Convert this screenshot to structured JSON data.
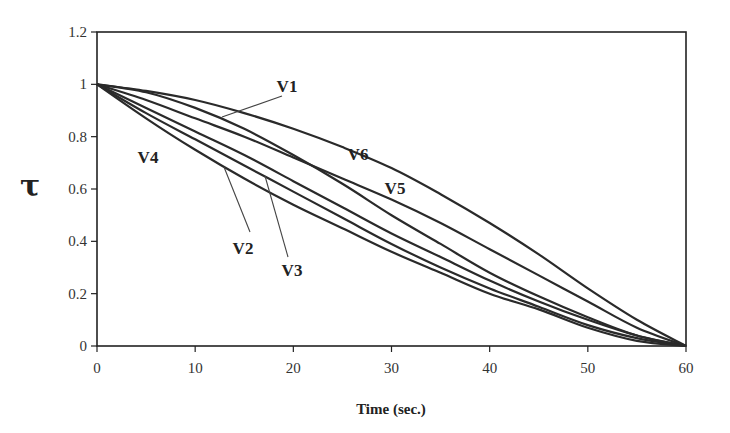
{
  "chart_data": {
    "type": "line",
    "title": "",
    "xlabel": "Time (sec.)",
    "ylabel": "τ",
    "xlim": [
      0,
      60
    ],
    "ylim": [
      0,
      1.2
    ],
    "x_ticks": [
      "0",
      "10",
      "20",
      "30",
      "40",
      "50",
      "60"
    ],
    "y_ticks": [
      "0",
      "0.2",
      "0.4",
      "0.6",
      "0.8",
      "1",
      "1.2"
    ],
    "grid": false,
    "legend": "inline labels",
    "x": [
      0,
      5,
      10,
      15,
      20,
      25,
      30,
      35,
      40,
      45,
      50,
      55,
      60
    ],
    "series": [
      {
        "name": "V6",
        "values": [
          1,
          0.975,
          0.94,
          0.89,
          0.83,
          0.76,
          0.68,
          0.58,
          0.47,
          0.35,
          0.22,
          0.1,
          0
        ]
      },
      {
        "name": "V1",
        "values": [
          1,
          0.97,
          0.91,
          0.83,
          0.73,
          0.62,
          0.5,
          0.39,
          0.28,
          0.19,
          0.11,
          0.04,
          0
        ]
      },
      {
        "name": "V5",
        "values": [
          1,
          0.94,
          0.87,
          0.8,
          0.72,
          0.64,
          0.56,
          0.47,
          0.37,
          0.27,
          0.17,
          0.07,
          0
        ]
      },
      {
        "name": "V3",
        "values": [
          1,
          0.91,
          0.82,
          0.73,
          0.63,
          0.53,
          0.43,
          0.34,
          0.25,
          0.17,
          0.1,
          0.04,
          0
        ]
      },
      {
        "name": "V2",
        "values": [
          1,
          0.89,
          0.79,
          0.69,
          0.59,
          0.49,
          0.39,
          0.3,
          0.22,
          0.15,
          0.08,
          0.03,
          0
        ]
      },
      {
        "name": "V4",
        "values": [
          1,
          0.87,
          0.75,
          0.64,
          0.54,
          0.45,
          0.36,
          0.28,
          0.2,
          0.14,
          0.07,
          0.02,
          0
        ]
      }
    ],
    "annotations": [
      {
        "text": "V1",
        "x": 287,
        "y": 92,
        "leader": [
          282,
          96,
          222,
          117
        ]
      },
      {
        "text": "V6",
        "x": 358,
        "y": 160,
        "leader": null
      },
      {
        "text": "V5",
        "x": 395,
        "y": 194,
        "leader": null
      },
      {
        "text": "V4",
        "x": 148,
        "y": 163,
        "leader": null
      },
      {
        "text": "V2",
        "x": 243,
        "y": 254,
        "leader": [
          224,
          167,
          250,
          232
        ]
      },
      {
        "text": "V3",
        "x": 292,
        "y": 276,
        "leader": [
          265,
          176,
          288,
          257
        ]
      }
    ]
  },
  "colors": {
    "line": "#2a2a2a",
    "axis": "#222222",
    "background": "#ffffff"
  }
}
